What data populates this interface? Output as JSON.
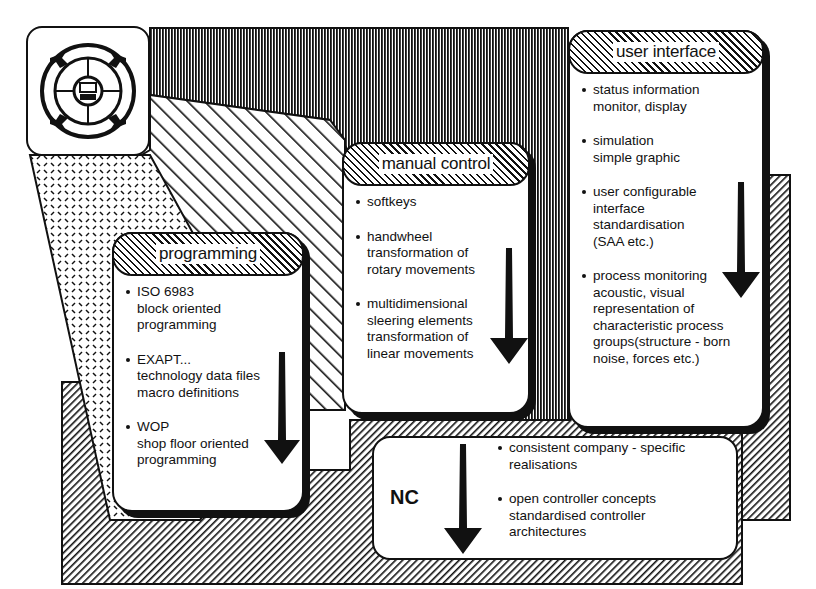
{
  "diagram": {
    "icon": {
      "name": "controller-dial-icon",
      "description": "circular control dial with four arrows and monitor in center"
    },
    "boxes": [
      {
        "id": "programming",
        "title": "programming",
        "items": [
          {
            "lines": [
              "ISO 6983",
              "block oriented",
              "programming"
            ]
          },
          {
            "lines": [
              "EXAPT...",
              "technology data files",
              "macro definitions"
            ]
          },
          {
            "lines": [
              "WOP",
              "shop floor oriented",
              "programming"
            ]
          }
        ]
      },
      {
        "id": "manual-control",
        "title": "manual control",
        "items": [
          {
            "lines": [
              "softkeys"
            ]
          },
          {
            "lines": [
              "handwheel",
              "transformation of",
              "rotary movements"
            ]
          },
          {
            "lines": [
              "multidimensional",
              "sleering elements",
              "transformation of",
              "linear movements"
            ]
          }
        ]
      },
      {
        "id": "user-interface",
        "title": "user interface",
        "items": [
          {
            "lines": [
              "status information",
              "monitor, display"
            ]
          },
          {
            "lines": [
              "simulation",
              "simple graphic"
            ]
          },
          {
            "lines": [
              "user configurable",
              "interface",
              "standardisation",
              "(SAA etc.)"
            ]
          },
          {
            "lines": [
              "process monitoring",
              "acoustic, visual",
              "representation of",
              "characteristic process",
              "groups(structure - born",
              "noise, forces etc.)"
            ]
          }
        ]
      }
    ],
    "nc": {
      "label": "NC",
      "items": [
        {
          "lines": [
            "consistent company - specific",
            "realisations"
          ]
        },
        {
          "lines": [
            "open controller concepts",
            "standardised controller",
            "architectures"
          ]
        }
      ]
    },
    "colors": {
      "ink": "#111111",
      "paper": "#ffffff"
    }
  }
}
